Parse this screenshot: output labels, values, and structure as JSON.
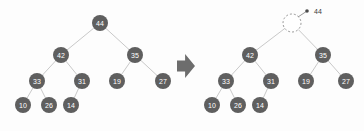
{
  "figure": {
    "background_color": "#fdfdfd",
    "node_color": "#5f5f5f",
    "node_text_color": "#ffffff",
    "edge_color": "#c9c9c9",
    "hole_stroke_color": "#9a9a9a",
    "callout_color": "#3c3c3c",
    "transform_arrow_color": "#6d6d6d"
  },
  "left_tree": {
    "name": "original-heap",
    "nodes": [
      {
        "id": "L0",
        "label": "44",
        "cx": 100,
        "cy": 23,
        "r": 8
      },
      {
        "id": "L1",
        "label": "42",
        "cx": 61,
        "cy": 55,
        "r": 8
      },
      {
        "id": "L2",
        "label": "35",
        "cx": 135,
        "cy": 55,
        "r": 8
      },
      {
        "id": "L3",
        "label": "33",
        "cx": 37,
        "cy": 81,
        "r": 8
      },
      {
        "id": "L4",
        "label": "31",
        "cx": 82,
        "cy": 81,
        "r": 8
      },
      {
        "id": "L5",
        "label": "19",
        "cx": 117,
        "cy": 81,
        "r": 8
      },
      {
        "id": "L6",
        "label": "27",
        "cx": 163,
        "cy": 81,
        "r": 8
      },
      {
        "id": "L7",
        "label": "10",
        "cx": 23,
        "cy": 105,
        "r": 8
      },
      {
        "id": "L8",
        "label": "26",
        "cx": 49,
        "cy": 105,
        "r": 8
      },
      {
        "id": "L9",
        "label": "14",
        "cx": 71,
        "cy": 105,
        "r": 8
      }
    ],
    "edges": [
      {
        "from": "L0",
        "to": "L1"
      },
      {
        "from": "L0",
        "to": "L2"
      },
      {
        "from": "L1",
        "to": "L3"
      },
      {
        "from": "L1",
        "to": "L4"
      },
      {
        "from": "L2",
        "to": "L5"
      },
      {
        "from": "L2",
        "to": "L6"
      },
      {
        "from": "L3",
        "to": "L7"
      },
      {
        "from": "L3",
        "to": "L8"
      },
      {
        "from": "L4",
        "to": "L9"
      }
    ]
  },
  "transform_arrow": {
    "name": "transform-arrow",
    "direction": "right",
    "x": 177,
    "y": 54,
    "width": 18,
    "height": 24
  },
  "right_tree": {
    "name": "heap-with-root-removed",
    "root_hole": {
      "id": "R0",
      "label": "",
      "cx": 292,
      "cy": 23,
      "r": 9,
      "dashed": true
    },
    "callout": {
      "label": "44",
      "text_x": 314,
      "text_y": 11,
      "line_start_x": 298,
      "line_start_y": 17,
      "line_end_x": 307,
      "line_end_y": 11
    },
    "nodes": [
      {
        "id": "R1",
        "label": "42",
        "cx": 250,
        "cy": 55,
        "r": 8
      },
      {
        "id": "R2",
        "label": "35",
        "cx": 323,
        "cy": 55,
        "r": 8
      },
      {
        "id": "R3",
        "label": "33",
        "cx": 226,
        "cy": 81,
        "r": 8
      },
      {
        "id": "R4",
        "label": "31",
        "cx": 271,
        "cy": 81,
        "r": 8
      },
      {
        "id": "R5",
        "label": "19",
        "cx": 306,
        "cy": 81,
        "r": 8
      },
      {
        "id": "R6",
        "label": "27",
        "cx": 346,
        "cy": 81,
        "r": 8
      },
      {
        "id": "R7",
        "label": "10",
        "cx": 212,
        "cy": 105,
        "r": 8
      },
      {
        "id": "R8",
        "label": "26",
        "cx": 238,
        "cy": 105,
        "r": 8
      },
      {
        "id": "R9",
        "label": "14",
        "cx": 260,
        "cy": 105,
        "r": 8
      }
    ],
    "edges": [
      {
        "from": "R0",
        "to": "R1"
      },
      {
        "from": "R0",
        "to": "R2"
      },
      {
        "from": "R1",
        "to": "R3"
      },
      {
        "from": "R1",
        "to": "R4"
      },
      {
        "from": "R2",
        "to": "R5"
      },
      {
        "from": "R2",
        "to": "R6"
      },
      {
        "from": "R3",
        "to": "R7"
      },
      {
        "from": "R3",
        "to": "R8"
      },
      {
        "from": "R4",
        "to": "R9"
      }
    ]
  }
}
